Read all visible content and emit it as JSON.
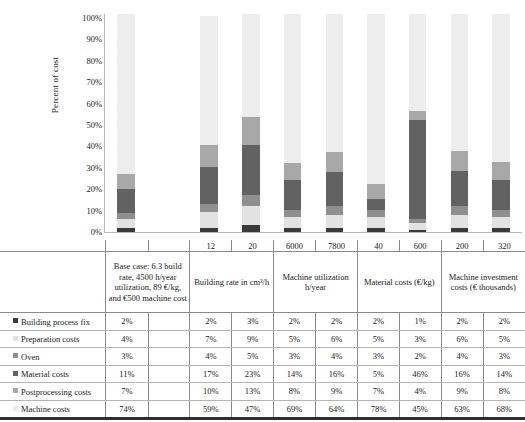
{
  "chart_data": {
    "type": "bar",
    "subtype": "stacked-100-percent",
    "title": "",
    "xlabel": "",
    "ylabel": "Percent of cost",
    "ylim": [
      0,
      100
    ],
    "yticks": [
      "0%",
      "10%",
      "20%",
      "30%",
      "40%",
      "50%",
      "60%",
      "70%",
      "80%",
      "90%",
      "100%"
    ],
    "grid": false,
    "legend_position": "table-row-headers",
    "categories": [
      "Base case",
      "",
      "12",
      "20",
      "6000",
      "7800",
      "40",
      "600",
      "200",
      "320"
    ],
    "group_headers": [
      "Base case: 6.3 build rate, 4500 h/year utilization, 89 €/kg, and €500 machine cost",
      "Building rate in cm³/h",
      "Machine utilization h/year",
      "Material costs (€/kg)",
      "Machine investment costs (€ thousands)"
    ],
    "series": [
      {
        "name": "Building process fix",
        "color": "#3a3a3a",
        "values": [
          2,
          null,
          2,
          3,
          2,
          2,
          2,
          1,
          2,
          2
        ]
      },
      {
        "name": "Preparation costs",
        "color": "#e2e2e2",
        "values": [
          4,
          null,
          7,
          9,
          5,
          6,
          5,
          3,
          6,
          5
        ]
      },
      {
        "name": "Oven",
        "color": "#8f8f8f",
        "values": [
          3,
          null,
          4,
          5,
          3,
          4,
          3,
          2,
          4,
          3
        ]
      },
      {
        "name": "Material costs",
        "color": "#626262",
        "values": [
          11,
          null,
          17,
          23,
          14,
          16,
          5,
          46,
          16,
          14
        ]
      },
      {
        "name": "Postprocessing costs",
        "color": "#a8a8a8",
        "values": [
          7,
          null,
          10,
          13,
          8,
          9,
          7,
          4,
          9,
          8
        ]
      },
      {
        "name": "Machine costs",
        "color": "#ededed",
        "values": [
          74,
          null,
          59,
          47,
          69,
          64,
          78,
          45,
          63,
          68
        ]
      }
    ]
  },
  "table": {
    "row_labels": [
      "Building process fix",
      "Preparation costs",
      "Oven",
      "Material costs",
      "Postprocessing costs",
      "Machine costs"
    ],
    "tick_labels": [
      "",
      "",
      "12",
      "20",
      "6000",
      "7800",
      "40",
      "600",
      "200",
      "320"
    ],
    "rows": [
      {
        "label": "Building process fix",
        "swatch": "#3a3a3a",
        "cells": [
          "2%",
          "",
          "2%",
          "3%",
          "2%",
          "2%",
          "2%",
          "1%",
          "2%",
          "2%"
        ]
      },
      {
        "label": "Preparation costs",
        "swatch": "#e2e2e2",
        "cells": [
          "4%",
          "",
          "7%",
          "9%",
          "5%",
          "6%",
          "5%",
          "3%",
          "6%",
          "5%"
        ]
      },
      {
        "label": "Oven",
        "swatch": "#8f8f8f",
        "cells": [
          "3%",
          "",
          "4%",
          "5%",
          "3%",
          "4%",
          "3%",
          "2%",
          "4%",
          "3%"
        ]
      },
      {
        "label": "Material costs",
        "swatch": "#626262",
        "cells": [
          "11%",
          "",
          "17%",
          "23%",
          "14%",
          "16%",
          "5%",
          "46%",
          "16%",
          "14%"
        ]
      },
      {
        "label": "Postprocessing costs",
        "swatch": "#a8a8a8",
        "cells": [
          "7%",
          "",
          "10%",
          "13%",
          "8%",
          "9%",
          "7%",
          "4%",
          "9%",
          "8%"
        ]
      },
      {
        "label": "Machine costs",
        "swatch": "#ededed",
        "cells": [
          "74%",
          "",
          "59%",
          "47%",
          "69%",
          "64%",
          "78%",
          "45%",
          "63%",
          "68%"
        ]
      }
    ],
    "headers": [
      {
        "text": "Base case: 6.3 build rate, 4500 h/year utilization, 89 €/kg, and €500 machine cost",
        "span": 2
      },
      {
        "text": "Building rate in cm³/h",
        "span": 2
      },
      {
        "text": "Machine utilization h/year",
        "span": 2
      },
      {
        "text": "Material costs (€/kg)",
        "span": 2
      },
      {
        "text": "Machine investment costs (€ thousands)",
        "span": 2
      }
    ]
  }
}
